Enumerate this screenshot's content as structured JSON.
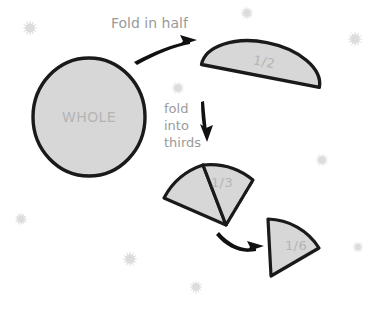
{
  "diagram": {
    "background_color": "#ffffff",
    "shape_fill_color": "#d7d7d7",
    "shape_stroke_color": "#1a1a1a",
    "label_color": "#b4b4b4",
    "caption_color": "#9a9a9a",
    "sparkle_color": "#dcdcdc",
    "shapes": [
      {
        "id": "whole-circle",
        "label": "WHOLE",
        "kind": "circle"
      },
      {
        "id": "half-shape",
        "label": "1/2",
        "kind": "semicircle"
      },
      {
        "id": "third-shape",
        "label": "1/3",
        "kind": "sector"
      },
      {
        "id": "sixth-shape",
        "label": "1/6",
        "kind": "sector"
      }
    ],
    "captions": [
      {
        "id": "fold-in-half",
        "text": "Fold in half"
      },
      {
        "id": "fold-into-thirds-line1",
        "text": "fold"
      },
      {
        "id": "fold-into-thirds-line2",
        "text": "into"
      },
      {
        "id": "fold-into-thirds-line3",
        "text": "thirds"
      }
    ],
    "arrows": [
      {
        "id": "arrow-to-half",
        "direction": "up-right"
      },
      {
        "id": "arrow-to-thirds",
        "direction": "down"
      },
      {
        "id": "arrow-to-sixth",
        "direction": "right"
      }
    ],
    "sparkles": [
      {
        "id": "sparkle-1",
        "x": 30,
        "y": 28
      },
      {
        "id": "sparkle-2",
        "x": 247,
        "y": 13
      },
      {
        "id": "sparkle-3",
        "x": 355,
        "y": 39
      },
      {
        "id": "sparkle-4",
        "x": 178,
        "y": 88
      },
      {
        "id": "sparkle-5",
        "x": 322,
        "y": 160
      },
      {
        "id": "sparkle-6",
        "x": 21,
        "y": 219
      },
      {
        "id": "sparkle-7",
        "x": 130,
        "y": 259
      },
      {
        "id": "sparkle-8",
        "x": 196,
        "y": 287
      },
      {
        "id": "sparkle-9",
        "x": 358,
        "y": 247
      }
    ]
  }
}
